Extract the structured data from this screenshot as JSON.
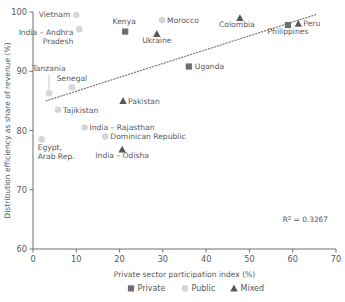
{
  "chart_data": {
    "type": "scatter",
    "title": "",
    "xlabel": "Private sector participation index (%)",
    "ylabel": "Distribution efficiency as share of revenue (%)",
    "xlim": [
      0,
      70
    ],
    "ylim": [
      60,
      100
    ],
    "xticks": [
      0,
      10,
      20,
      30,
      40,
      50,
      60,
      70
    ],
    "yticks": [
      60,
      70,
      80,
      90,
      100
    ],
    "grid": false,
    "annotation": "R² = 0.3267",
    "r_squared": 0.3267,
    "legend_position": "bottom",
    "trendline": {
      "type": "linear-dotted",
      "x_start": 3.0,
      "y_start": 85.0,
      "x_end": 65.5,
      "y_end": 99.6
    },
    "series": [
      {
        "name": "Private",
        "marker": "square",
        "color": "#6d6e71",
        "points": [
          {
            "label": "Kenya",
            "x": 21.3,
            "y": 96.7,
            "label_dx": -1,
            "label_dy": -8,
            "label_anchor": "middle"
          },
          {
            "label": "Uganda",
            "x": 36.0,
            "y": 90.8,
            "label_dx": 6,
            "label_dy": 2.5,
            "label_anchor": "start"
          },
          {
            "label": "Philippines",
            "x": 58.9,
            "y": 97.8,
            "label_dx": 0,
            "label_dy": 9,
            "label_anchor": "middle"
          }
        ]
      },
      {
        "name": "Public",
        "marker": "circle",
        "color": "#d5d6d8",
        "points": [
          {
            "label": "Vietnam",
            "x": 10.0,
            "y": 99.5,
            "label_dx": -6,
            "label_dy": 2.5,
            "label_anchor": "end"
          },
          {
            "label": "India – Andhra Pradesh",
            "x": 10.7,
            "y": 97.1,
            "label_dx": -6,
            "label_dy": 6,
            "label_anchor": "end",
            "two_line": true
          },
          {
            "label": "Morocco",
            "x": 29.8,
            "y": 98.6,
            "label_dx": 5,
            "label_dy": 2.5,
            "label_anchor": "start"
          },
          {
            "label": "Tanzania",
            "x": 3.7,
            "y": 86.3,
            "label_dx": 0,
            "label_dy": -22,
            "label_anchor": "middle",
            "leader": true
          },
          {
            "label": "Senegal",
            "x": 9.0,
            "y": 87.3,
            "label_dx": 0,
            "label_dy": -6,
            "label_anchor": "middle"
          },
          {
            "label": "Tajikistan",
            "x": 5.8,
            "y": 83.5,
            "label_dx": 5,
            "label_dy": 2.8,
            "label_anchor": "start"
          },
          {
            "label": "India – Rajasthan",
            "x": 11.9,
            "y": 80.5,
            "label_dx": 5,
            "label_dy": 2.8,
            "label_anchor": "start"
          },
          {
            "label": "Dominican Republic",
            "x": 16.7,
            "y": 79.0,
            "label_dx": 5,
            "label_dy": 2.8,
            "label_anchor": "start"
          },
          {
            "label": "Egypt, Arab Rep.",
            "x": 2.0,
            "y": 78.5,
            "label_dx": -1,
            "label_dy": 11,
            "label_anchor": "middle",
            "two_line": true
          }
        ]
      },
      {
        "name": "Mixed",
        "marker": "triangle",
        "color": "#58585a",
        "points": [
          {
            "label": "Ukraine",
            "x": 28.6,
            "y": 96.3,
            "label_dx": 0,
            "label_dy": 9,
            "label_anchor": "middle"
          },
          {
            "label": "Colombia",
            "x": 47.8,
            "y": 99.0,
            "label_dx": -3,
            "label_dy": 9,
            "label_anchor": "middle"
          },
          {
            "label": "Peru",
            "x": 61.3,
            "y": 98.0,
            "label_dx": 5,
            "label_dy": 2.5,
            "label_anchor": "start"
          },
          {
            "label": "Pakistan",
            "x": 20.8,
            "y": 85.0,
            "label_dx": 5,
            "label_dy": 2.8,
            "label_anchor": "start"
          },
          {
            "label": "India – Odisha",
            "x": 20.6,
            "y": 76.8,
            "label_dx": 0,
            "label_dy": 9,
            "label_anchor": "middle"
          }
        ]
      }
    ],
    "legend": [
      {
        "name": "Private",
        "marker": "square",
        "color": "#6d6e71"
      },
      {
        "name": "Public",
        "marker": "circle",
        "color": "#d5d6d8"
      },
      {
        "name": "Mixed",
        "marker": "triangle",
        "color": "#58585a"
      }
    ]
  }
}
